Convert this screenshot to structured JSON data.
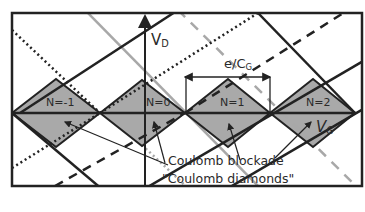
{
  "diagram": {
    "title": "Coulomb diamonds",
    "axes": {
      "x_label": "V",
      "x_label_sub": "G",
      "y_label": "V",
      "y_label_sub": "D"
    },
    "period_label": "e/C",
    "period_label_sub": "G",
    "diamonds": [
      {
        "label": "N=-1"
      },
      {
        "label": "N=0"
      },
      {
        "label": "N=1"
      },
      {
        "label": "N=2"
      }
    ],
    "annotations": {
      "blockade": "Coulomb blockade",
      "diamonds": "\"Coulomb diamonds\""
    },
    "colors": {
      "diamond_fill": "#a9a9a9",
      "line": "#222222",
      "gray_line": "#a8a8a8",
      "background": "#ffffff"
    }
  }
}
